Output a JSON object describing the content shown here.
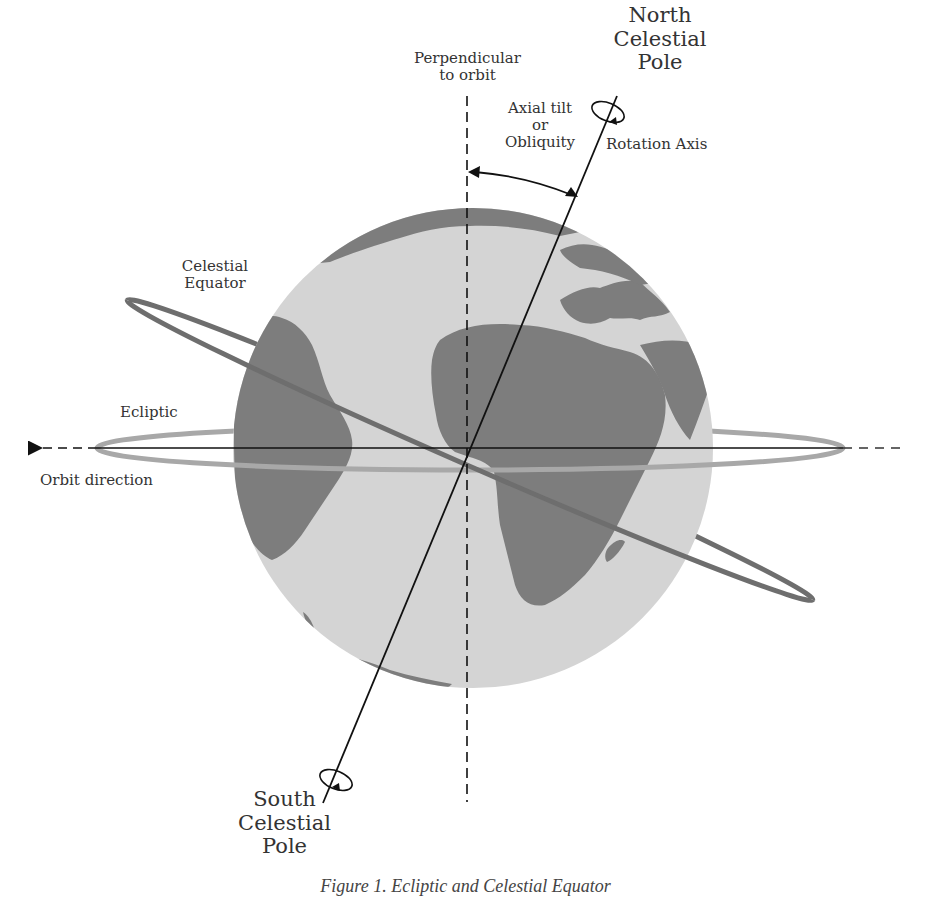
{
  "figure": {
    "caption": "Figure 1. Ecliptic and Celestial Equator",
    "labels": {
      "perpendicular": "Perpendicular\nto orbit",
      "north_pole": "North\nCelestial\nPole",
      "axial_tilt": "Axial tilt\nor\nObliquity",
      "rotation_axis": "Rotation Axis",
      "celestial_equator": "Celestial\nEquator",
      "ecliptic": "Ecliptic",
      "orbit_direction": "Orbit direction",
      "south_pole": "South\nCelestial\nPole"
    },
    "colors": {
      "ocean": "#d4d4d4",
      "land": "#7d7d7d",
      "celestial_equator_ring": "#6e6e6e",
      "ecliptic_ring": "#a8a8a8",
      "lines": "#111111"
    },
    "elements": [
      "globe",
      "rotation-axis",
      "perpendicular-dashed-line",
      "orbit-line",
      "celestial-equator-ring",
      "ecliptic-ring",
      "axial-tilt-arc",
      "north-rotation-ellipse",
      "south-rotation-ellipse"
    ]
  }
}
